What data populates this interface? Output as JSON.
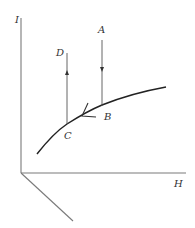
{
  "diagram": {
    "type": "3d-axes process diagram",
    "axes": {
      "vertical": {
        "label": "I"
      },
      "horizontal": {
        "label": "H"
      },
      "depth": {
        "label": ""
      }
    },
    "points": {
      "A": {
        "label": "A"
      },
      "B": {
        "label": "B"
      },
      "C": {
        "label": "C"
      },
      "D": {
        "label": "D"
      }
    },
    "segments": [
      {
        "from": "A",
        "to": "B",
        "direction": "down"
      },
      {
        "from": "B",
        "to": "C",
        "direction": "along curve toward C"
      },
      {
        "from": "C",
        "to": "D",
        "direction": "up"
      }
    ],
    "colors": {
      "axis": "#7a7a7a",
      "curve": "#222222",
      "line": "#555555",
      "text": "#333333"
    }
  }
}
